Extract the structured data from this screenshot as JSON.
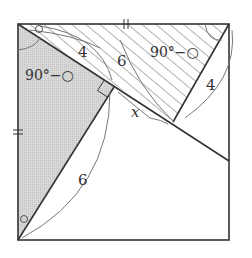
{
  "diagram": {
    "colors": {
      "stroke": "#333333",
      "gray_fill": "#d4d4d4",
      "hatch": "#666666",
      "arc": "#777777",
      "background": "#ffffff"
    },
    "labels": {
      "seg_4_top": "4",
      "seg_6_top": "6",
      "angle_left": "90°−○",
      "angle_right": "90°−○",
      "seg_4_right": "4",
      "seg_x": "x",
      "seg_6_bottom": "6"
    },
    "markers": {
      "angle_circle_symbol": "○",
      "equal_tick_top": "double-tick",
      "equal_tick_left": "double-tick",
      "right_angle": "square-marker"
    }
  }
}
